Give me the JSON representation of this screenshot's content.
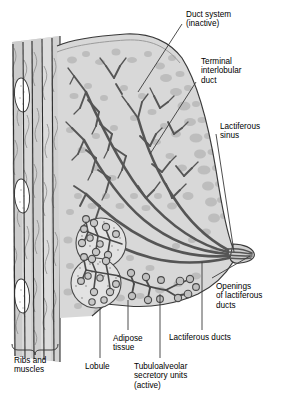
{
  "figure": {
    "background_color": "#ffffff",
    "ink_color": "#000000",
    "duct_color": "#555555",
    "tissue_fill": "#d8d8d8",
    "stipple_fill": "#bdbdbd",
    "rib_fill": "#ffffff"
  },
  "labels": {
    "duct_system": "Duct system\n(inactive)",
    "terminal_interlobular_duct": "Terminal\ninterlobular\nduct",
    "lactiferous_sinus": "Lactiferous\nsinus",
    "openings_of_lactiferous_ducts": "Openings\nof lactiferous\nducts",
    "lactiferous_ducts": "Lactiferous ducts",
    "tubuloalveolar": "Tubuloalveolar\nsecretory units\n(active)",
    "adipose_tissue": "Adipose\ntissue",
    "lobule": "Lobule",
    "ribs_and_muscles": "Ribs and\nmuscles"
  }
}
